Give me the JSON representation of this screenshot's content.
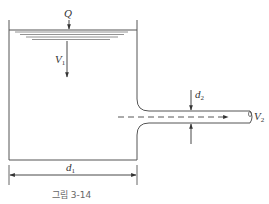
{
  "diagram": {
    "labels": {
      "flow_rate": "Q",
      "tank_velocity": "V",
      "tank_velocity_sub": "1",
      "pipe_diameter": "d",
      "pipe_diameter_sub": "2",
      "exit_velocity": "V",
      "exit_velocity_sub": "2",
      "tank_diameter": "d",
      "tank_diameter_sub": "1"
    },
    "caption": "그림 3-14",
    "colors": {
      "line": "#444444",
      "caption": "#666666"
    }
  }
}
